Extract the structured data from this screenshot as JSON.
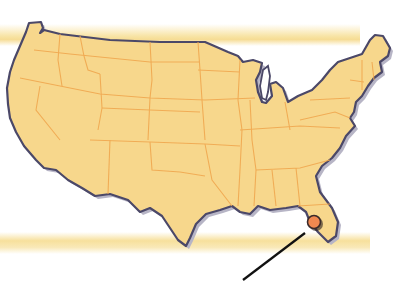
{
  "map": {
    "subject": "Contiguous United States outline map",
    "marker": {
      "label": "location-pin",
      "region": "Florida (Gulf coast, Tampa Bay area)",
      "x": 314,
      "y": 222
    },
    "leader_line": {
      "from": [
        305,
        233
      ],
      "to": [
        243,
        280
      ]
    },
    "colors": {
      "land": "#f7d78c",
      "state_border": "#f0a850",
      "coastline": "#4b4868",
      "shadow": "#b7b5c6",
      "band": "#f6dc94",
      "marker_fill": "#f08850",
      "marker_stroke": "#3a2a2a",
      "leader_line": "#111111",
      "background": "#ffffff"
    }
  }
}
